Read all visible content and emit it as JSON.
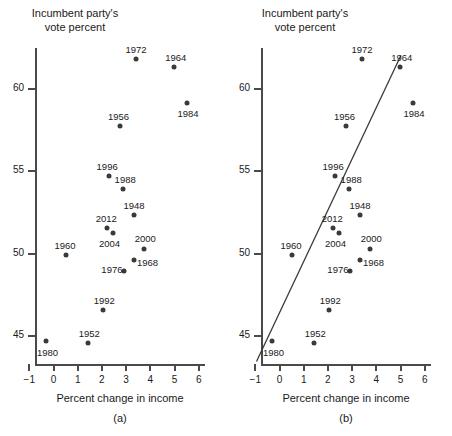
{
  "figure": {
    "panels": [
      {
        "id": "a",
        "label": "(a)",
        "ytitle": "Incumbent party's\nvote percent",
        "xlabel": "Percent change in income",
        "has_fit_line": false
      },
      {
        "id": "b",
        "label": "(b)",
        "ytitle": "Incumbent party's\nvote percent",
        "xlabel": "Percent change in income",
        "has_fit_line": true
      }
    ]
  },
  "chart_data": {
    "type": "scatter",
    "title": "",
    "xlabel": "Percent change in income",
    "ylabel": "Incumbent party's vote percent",
    "xlim": [
      -1.4,
      6.4
    ],
    "ylim": [
      43.2,
      63.4
    ],
    "xticks": [
      -1,
      0,
      1,
      2,
      3,
      4,
      5,
      6
    ],
    "xticklabels": [
      "−1",
      "0",
      "1",
      "2",
      "3",
      "4",
      "5",
      "6"
    ],
    "yticks": [
      45,
      50,
      55,
      60
    ],
    "yticklabels": [
      "45",
      "50",
      "55",
      "60"
    ],
    "grid": false,
    "legend": null,
    "point_labels_shown": true,
    "points": [
      {
        "label": "1948",
        "x": 3.33,
        "y": 52.37,
        "label_dx": 0,
        "label_dy": -10
      },
      {
        "label": "1952",
        "x": 1.44,
        "y": 44.59,
        "label_dx": 1,
        "label_dy": -10
      },
      {
        "label": "1956",
        "x": 2.73,
        "y": 57.76,
        "label_dx": -1,
        "label_dy": -10
      },
      {
        "label": "1960",
        "x": 0.52,
        "y": 49.91,
        "label_dx": -1,
        "label_dy": -10
      },
      {
        "label": "1964",
        "x": 4.97,
        "y": 61.34,
        "label_dx": 2,
        "label_dy": -10
      },
      {
        "label": "1968",
        "x": 3.31,
        "y": 49.6,
        "label_dx": 14,
        "label_dy": 2
      },
      {
        "label": "1972",
        "x": 3.41,
        "y": 61.79,
        "label_dx": 0,
        "label_dy": -10
      },
      {
        "label": "1976",
        "x": 2.91,
        "y": 48.95,
        "label_dx": -12,
        "label_dy": -2
      },
      {
        "label": "1980",
        "x": -0.29,
        "y": 44.7,
        "label_dx": 1,
        "label_dy": 11
      },
      {
        "label": "1984",
        "x": 5.52,
        "y": 59.17,
        "label_dx": 1,
        "label_dy": 10
      },
      {
        "label": "1988",
        "x": 2.88,
        "y": 53.9,
        "label_dx": 2,
        "label_dy": -10
      },
      {
        "label": "1992",
        "x": 2.06,
        "y": 46.55,
        "label_dx": 1,
        "label_dy": -10
      },
      {
        "label": "1996",
        "x": 2.3,
        "y": 54.74,
        "label_dx": -2,
        "label_dy": -10
      },
      {
        "label": "2000",
        "x": 3.75,
        "y": 50.27,
        "label_dx": 1,
        "label_dy": -11
      },
      {
        "label": "2004",
        "x": 2.44,
        "y": 51.24,
        "label_dx": -3,
        "label_dy": 10
      },
      {
        "label": "2012",
        "x": 2.22,
        "y": 51.55,
        "label_dx": -1,
        "label_dy": -10
      }
    ],
    "fit_line": {
      "type": "linear-regression",
      "x_start": -0.95,
      "y_start": 43.45,
      "x_end": 5.02,
      "y_end": 62.05
    }
  }
}
